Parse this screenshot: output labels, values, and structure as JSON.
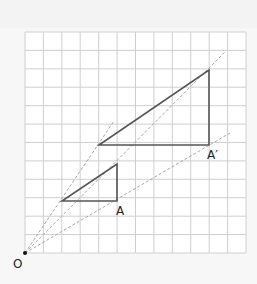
{
  "diagram": {
    "title": "",
    "grid": {
      "columns": 12,
      "rows": 12
    },
    "origin": {
      "label": "O",
      "x": 0,
      "y": 0
    },
    "small_triangle": {
      "vertices": [
        [
          2,
          3
        ],
        [
          5,
          3
        ],
        [
          5,
          5
        ]
      ],
      "labeled_vertex": "A"
    },
    "large_triangle": {
      "vertices": [
        [
          4,
          6
        ],
        [
          10,
          6
        ],
        [
          10,
          10
        ]
      ],
      "labeled_vertex": "A′"
    },
    "scale_factor": 2,
    "labels": {
      "origin": "O",
      "A": "A",
      "A_prime": "A′"
    },
    "colors": {
      "grid": "#cfcfcf",
      "triangle": "#555555",
      "ray": "#a8a8a8",
      "background": "#ffffff"
    }
  }
}
